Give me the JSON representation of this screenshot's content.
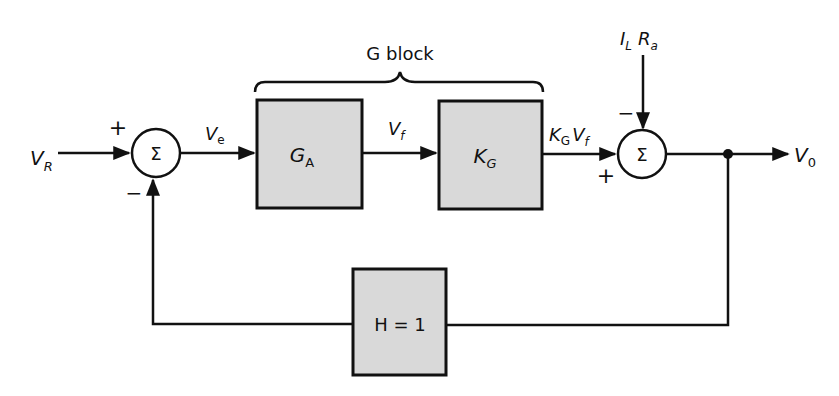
{
  "diagram": {
    "type": "block-diagram",
    "colors": {
      "block_fill": "#d9d9d9",
      "stroke": "#111111",
      "background": "#ffffff"
    },
    "brace_label": "G block",
    "inputs": {
      "reference": {
        "main": "V",
        "sub": "R"
      },
      "disturbance": {
        "part1_main": "I",
        "part1_sub": "L",
        "part2_main": "R",
        "part2_sub": "a"
      }
    },
    "output": {
      "main": "V",
      "sub": "0"
    },
    "summing_junctions": [
      {
        "id": "sum1",
        "symbol": "Σ",
        "signs": {
          "left": "+",
          "bottom": "−"
        }
      },
      {
        "id": "sum2",
        "symbol": "Σ",
        "signs": {
          "left": "+",
          "top": "−"
        }
      }
    ],
    "blocks": [
      {
        "id": "ga",
        "main": "G",
        "sub": "A"
      },
      {
        "id": "kg",
        "main": "K",
        "sub": "G"
      },
      {
        "id": "h",
        "label": "H = 1"
      }
    ],
    "signals": {
      "error": {
        "main": "V",
        "sub": "e"
      },
      "field": {
        "main": "V",
        "sub": "f"
      },
      "kg_out": {
        "main1": "K",
        "sub1": "G",
        "main2": "V",
        "sub2": "f"
      }
    }
  }
}
